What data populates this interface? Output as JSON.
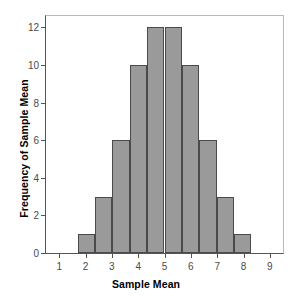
{
  "chart_data": {
    "type": "bar",
    "title": "",
    "xlabel": "Sample Mean",
    "ylabel": "Frequency of Sample Mean",
    "xlim": [
      0.5,
      9.5
    ],
    "ylim": [
      0,
      12.6
    ],
    "grid": false,
    "legend": null,
    "bar_color": "#9a9a9a",
    "bar_edge_color": "#4a4a4a",
    "axis_color": "#555555",
    "frame_color": "#b9b9b9",
    "xticks": [
      1,
      2,
      3,
      4,
      5,
      6,
      7,
      8,
      9
    ],
    "xtick_labels": [
      "1",
      "2",
      "3",
      "4",
      "5",
      "6",
      "7",
      "8",
      "9"
    ],
    "yticks": [
      0,
      2,
      4,
      6,
      8,
      10,
      12
    ],
    "ytick_labels": [
      "0",
      "2",
      "4",
      "6",
      "8",
      "10",
      "12"
    ],
    "bin_edges": [
      1.7,
      2.36,
      3.02,
      3.68,
      4.34,
      5.0,
      5.66,
      6.32,
      6.98,
      7.64,
      8.3
    ],
    "bin_centers": [
      2.03,
      2.69,
      3.35,
      4.01,
      4.67,
      5.33,
      5.99,
      6.65,
      7.31,
      7.97
    ],
    "values": [
      1,
      3,
      6,
      10,
      12,
      12,
      10,
      6,
      3,
      1
    ],
    "categories": [
      "1.70-2.36",
      "2.36-3.02",
      "3.02-3.68",
      "3.68-4.34",
      "4.34-5.00",
      "5.00-5.66",
      "5.66-6.32",
      "6.32-6.98",
      "6.98-7.64",
      "7.64-8.30"
    ]
  }
}
